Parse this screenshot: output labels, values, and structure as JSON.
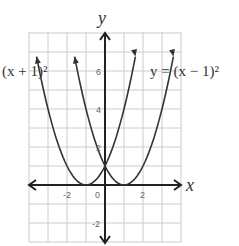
{
  "chart_data": {
    "type": "line",
    "title": "",
    "xlabel": "x",
    "ylabel": "y",
    "xlim": [
      -4,
      4
    ],
    "ylim": [
      -3,
      8
    ],
    "grid": true,
    "x_tick_labels": [
      "-2",
      "0",
      "2"
    ],
    "y_tick_labels": [
      "6",
      "4",
      "2",
      "-2"
    ],
    "series": [
      {
        "name": "(x + 1)²",
        "equation": "y = (x + 1)^2",
        "vertex": [
          -1,
          0
        ],
        "x": [
          -3.7,
          -3,
          -2,
          -1,
          0,
          1,
          1.7
        ],
        "values": [
          7.3,
          4,
          1,
          0,
          1,
          4,
          7.3
        ]
      },
      {
        "name": "y = (x − 1)²",
        "equation": "y = (x - 1)^2",
        "vertex": [
          1,
          0
        ],
        "x": [
          -1.7,
          -1,
          0,
          1,
          2,
          3,
          3.7
        ],
        "values": [
          7.3,
          4,
          1,
          0,
          1,
          4,
          7.3
        ]
      }
    ],
    "annotations": [
      "(x + 1)²",
      "y = (x − 1)²"
    ]
  },
  "labels": {
    "x_axis": "x",
    "y_axis": "y",
    "left_curve": "(x + 1)²",
    "right_curve": "y = (x − 1)²",
    "ticks": {
      "xm2": "-2",
      "x0": "0",
      "x2": "2",
      "y6": "6",
      "y4": "4",
      "y2": "2",
      "ym2": "-2"
    }
  },
  "colors": {
    "curve": "#333333",
    "axis": "#222222",
    "grid": "#cccccc"
  }
}
